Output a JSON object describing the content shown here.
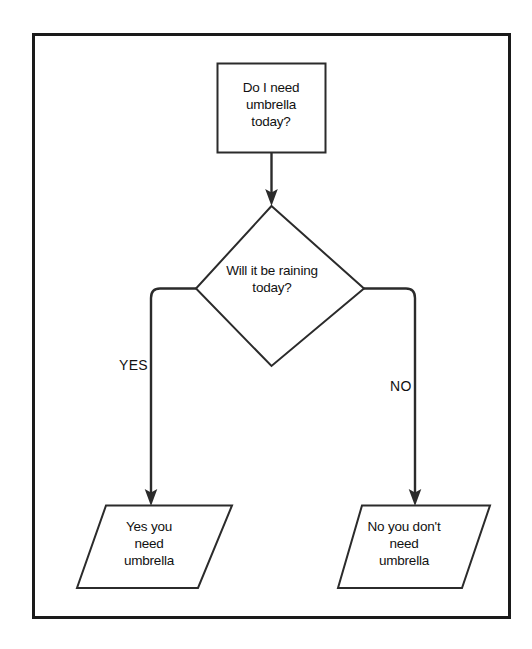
{
  "diagram": {
    "border": {
      "name": "outer-frame",
      "color": "#1a1a1a"
    },
    "style": {
      "stroke": "#2b2b2b",
      "fill": "#ffffff",
      "text_color": "#111111"
    },
    "nodes": [
      {
        "id": "process-start",
        "shape": "rectangle",
        "text": "Do I need\numbrella\ntoday?"
      },
      {
        "id": "decision-rain",
        "shape": "diamond",
        "text": "Will it be raining\ntoday?"
      },
      {
        "id": "terminal-yes",
        "shape": "parallelogram",
        "text": "Yes you\nneed\numbrella"
      },
      {
        "id": "terminal-no",
        "shape": "parallelogram",
        "text": "No you don't\nneed\numbrella"
      }
    ],
    "edges": [
      {
        "id": "edge-start-to-decision",
        "from": "process-start",
        "to": "decision-rain",
        "label": ""
      },
      {
        "id": "edge-decision-yes",
        "from": "decision-rain",
        "to": "terminal-yes",
        "label": "YES"
      },
      {
        "id": "edge-decision-no",
        "from": "decision-rain",
        "to": "terminal-no",
        "label": "NO"
      }
    ]
  }
}
